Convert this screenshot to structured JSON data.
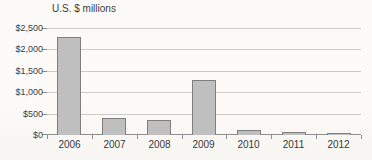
{
  "chart_data": {
    "type": "bar",
    "title": "U.S. $ millions",
    "categories": [
      "2006",
      "2007",
      "2008",
      "2009",
      "2010",
      "2011",
      "2012"
    ],
    "values": [
      2300,
      400,
      360,
      1290,
      120,
      60,
      55
    ],
    "xlabel": "",
    "ylabel": "U.S. $ millions",
    "ylim": [
      0,
      2500
    ],
    "ytick_interval": 500,
    "ytick_labels": [
      "$0",
      "$500",
      "$1,000",
      "$1,500",
      "$2,000",
      "$2,500"
    ],
    "grid": true,
    "legend_position": "none",
    "colors": {
      "bar_fill": "#bfbfbf",
      "bar_border": "#7f7f7f",
      "gridline": "#cbcbcb",
      "axis": "#8f8f8f",
      "text": "#404040",
      "background": "#fcfbf9"
    }
  }
}
